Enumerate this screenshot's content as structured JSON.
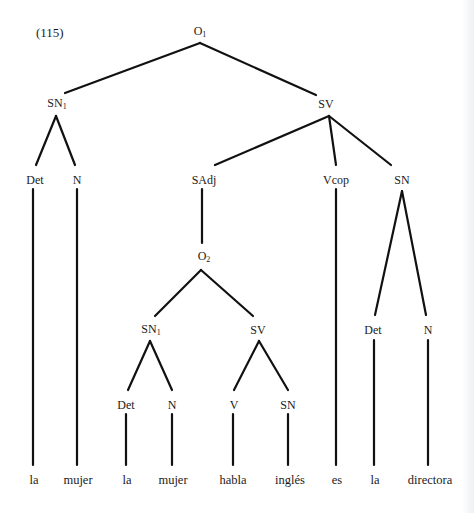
{
  "example_number": "(115)",
  "nodes": {
    "root": {
      "base": "O",
      "sub": "1"
    },
    "sn1_top": {
      "base": "SN",
      "sub": "1"
    },
    "sv_top": {
      "base": "SV",
      "sub": ""
    },
    "det_1": {
      "base": "Det",
      "sub": ""
    },
    "n_1": {
      "base": "N",
      "sub": ""
    },
    "sadj": {
      "base": "SAdj",
      "sub": ""
    },
    "vcop": {
      "base": "Vcop",
      "sub": ""
    },
    "sn_pred": {
      "base": "SN",
      "sub": ""
    },
    "o2": {
      "base": "O",
      "sub": "2"
    },
    "sn1_inner": {
      "base": "SN",
      "sub": "1"
    },
    "sv_inner": {
      "base": "SV",
      "sub": ""
    },
    "det_pred": {
      "base": "Det",
      "sub": ""
    },
    "n_pred": {
      "base": "N",
      "sub": ""
    },
    "det_inner": {
      "base": "Det",
      "sub": ""
    },
    "n_inner": {
      "base": "N",
      "sub": ""
    },
    "v_inner": {
      "base": "V",
      "sub": ""
    },
    "sn_inner_obj": {
      "base": "SN",
      "sub": ""
    }
  },
  "words": [
    "la",
    "mujer",
    "la",
    "mujer",
    "habla",
    "inglés",
    "es",
    "la",
    "directora"
  ],
  "style": {
    "line_color": "#111111",
    "text_color": "#1a1a1a"
  }
}
